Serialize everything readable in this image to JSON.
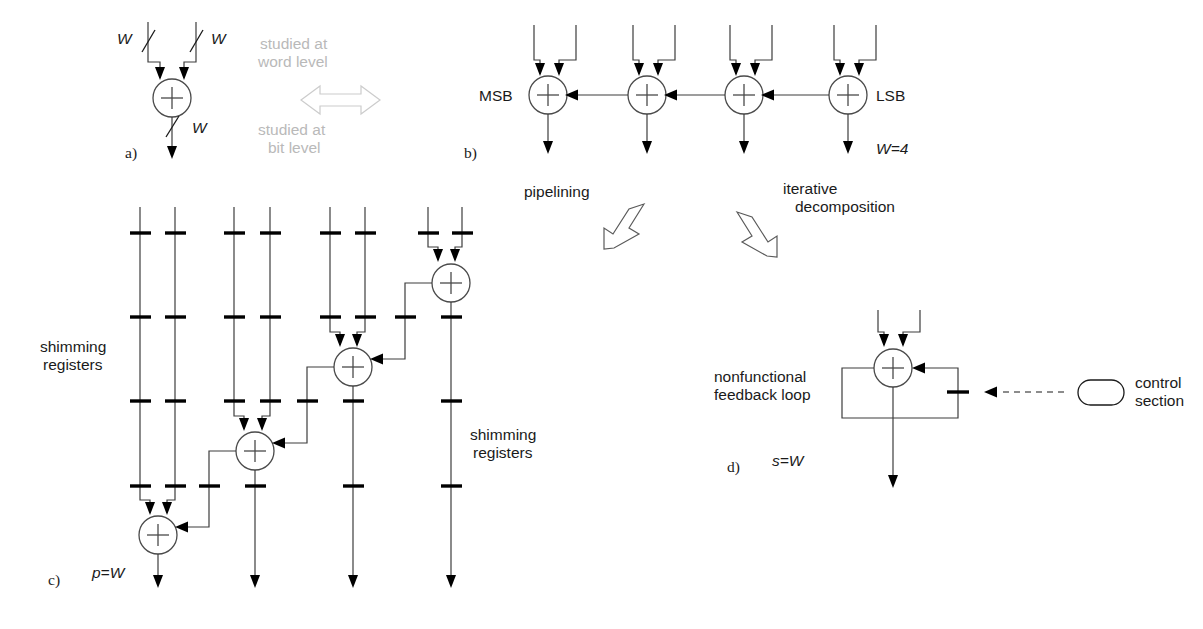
{
  "figure": {
    "background_color": "#ffffff",
    "line_color": "#3d3d3d",
    "register_color": "#000000",
    "gray_label_color": "#b9b9b9"
  },
  "panels": {
    "a": {
      "label": "a)",
      "input_left_label": "W",
      "input_right_label": "W",
      "output_label": "W",
      "operator": "+"
    },
    "b": {
      "label": "b)",
      "left_label": "MSB",
      "right_label": "LSB",
      "width_label": "W=4",
      "adder_count": 4,
      "operator": "+"
    },
    "c": {
      "label": "c)",
      "throughput_label": "p=W",
      "shimming_left": "shimming\nregisters",
      "shimming_left_line1": "shimming",
      "shimming_left_line2": "registers",
      "shimming_right_line1": "shimming",
      "shimming_right_line2": "registers",
      "adder_count": 4,
      "register_rows": 4,
      "operator": "+"
    },
    "d": {
      "label": "d)",
      "latency_label": "s=W",
      "feedback_line1": "nonfunctional",
      "feedback_line2": "feedback loop",
      "control_line1": "control",
      "control_line2": "section",
      "operator": "+"
    }
  },
  "annotations": {
    "word_level_line1": "studied at",
    "word_level_line2": "word level",
    "bit_level_line1": "studied at",
    "bit_level_line2": "bit level",
    "pipelining": "pipelining",
    "iterative_line1": "iterative",
    "iterative_line2": "decomposition"
  }
}
